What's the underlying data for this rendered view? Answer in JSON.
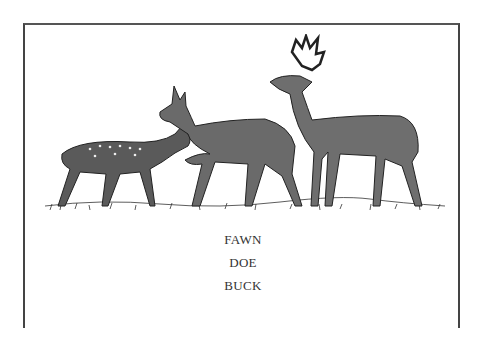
{
  "figure": {
    "illustration": {
      "description": "Engraving of three white-tailed deer standing on grass",
      "subjects": [
        "fawn",
        "doe",
        "buck"
      ]
    },
    "labels": [
      "FAWN",
      "DOE",
      "BUCK"
    ]
  }
}
